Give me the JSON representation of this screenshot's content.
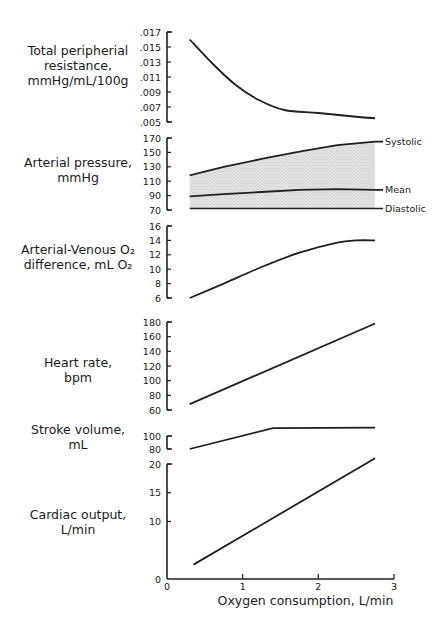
{
  "figure": {
    "x_axis": {
      "label": "Oxygen consumption, L/min",
      "ticks": [
        "0",
        "1",
        "2",
        "3"
      ],
      "range": [
        0,
        3
      ]
    },
    "panels": [
      {
        "id": "tpr",
        "label_lines": [
          "Total peripherial",
          "resistance,",
          "mmHg/mL/100g"
        ],
        "ticks": [
          ".017",
          ".015",
          ".013",
          ".011",
          ".009",
          ".007",
          ".005"
        ]
      },
      {
        "id": "pressure",
        "label_lines": [
          "Arterial pressure,",
          "mmHg"
        ],
        "ticks": [
          "170",
          "150",
          "130",
          "110",
          "90",
          "70"
        ],
        "series_labels": [
          "Systolic",
          "Mean",
          "Diastolic"
        ]
      },
      {
        "id": "avo2",
        "label_lines": [
          "Arterial-Venous O₂",
          "difference,  mL O₂"
        ],
        "ticks": [
          "16",
          "14",
          "12",
          "10",
          "8",
          "6"
        ]
      },
      {
        "id": "hr",
        "label_lines": [
          "Heart rate,",
          "bpm"
        ],
        "ticks": [
          "180",
          "160",
          "140",
          "120",
          "100",
          "80",
          "60"
        ]
      },
      {
        "id": "sv",
        "label_lines": [
          "Stroke volume,",
          "mL"
        ],
        "ticks": [
          "100",
          "80"
        ]
      },
      {
        "id": "co",
        "label_lines": [
          "Cardiac output,",
          "L/min"
        ],
        "ticks": [
          "20",
          "15",
          "10",
          "0"
        ]
      }
    ]
  },
  "chart_data": [
    {
      "type": "line",
      "title": "Total peripherial resistance",
      "ylabel": "Total peripherial resistance, mmHg/mL/100g",
      "xlabel": "Oxygen consumption, L/min",
      "ylim": [
        0.005,
        0.017
      ],
      "yticks": [
        0.017,
        0.015,
        0.013,
        0.011,
        0.009,
        0.007,
        0.005
      ],
      "grid": false,
      "x": [
        0.3,
        0.6,
        0.9,
        1.2,
        1.55,
        2.0,
        2.5,
        2.75
      ],
      "values": [
        0.016,
        0.0128,
        0.01,
        0.008,
        0.0066,
        0.0062,
        0.0057,
        0.0055
      ]
    },
    {
      "type": "area",
      "title": "Arterial pressure",
      "ylabel": "Arterial pressure, mmHg",
      "xlabel": "Oxygen consumption, L/min",
      "ylim": [
        70,
        170
      ],
      "yticks": [
        170,
        150,
        130,
        110,
        90,
        70
      ],
      "grid": false,
      "x": [
        0.3,
        0.75,
        1.25,
        1.75,
        2.25,
        2.75
      ],
      "series": [
        {
          "name": "Systolic",
          "values": [
            118,
            130,
            141,
            151,
            160,
            165
          ]
        },
        {
          "name": "Mean",
          "values": [
            89,
            92,
            95,
            98,
            99,
            98
          ]
        },
        {
          "name": "Diastolic",
          "values": [
            72,
            72,
            72,
            72,
            72,
            72
          ]
        }
      ],
      "annotations": [
        "Systolic",
        "Mean",
        "Diastolic"
      ],
      "fill": "shaded region between Systolic and Diastolic"
    },
    {
      "type": "line",
      "title": "Arterial-Venous O2 difference",
      "ylabel": "Arterial-Venous O2 difference, mL O2",
      "xlabel": "Oxygen consumption, L/min",
      "ylim": [
        6,
        16
      ],
      "yticks": [
        16,
        14,
        12,
        10,
        8,
        6
      ],
      "grid": false,
      "x": [
        0.3,
        0.75,
        1.25,
        1.75,
        2.25,
        2.5,
        2.75
      ],
      "values": [
        6.0,
        8.0,
        10.3,
        12.3,
        13.7,
        14.0,
        14.0
      ]
    },
    {
      "type": "line",
      "title": "Heart rate",
      "ylabel": "Heart rate, bpm",
      "xlabel": "Oxygen consumption, L/min",
      "ylim": [
        60,
        180
      ],
      "yticks": [
        180,
        160,
        140,
        120,
        100,
        80,
        60
      ],
      "grid": false,
      "x": [
        0.3,
        2.75
      ],
      "values": [
        68,
        178
      ]
    },
    {
      "type": "line",
      "title": "Stroke volume",
      "ylabel": "Stroke volume, mL",
      "xlabel": "Oxygen consumption, L/min",
      "ylim": [
        80,
        100
      ],
      "yticks": [
        100,
        80
      ],
      "grid": false,
      "x": [
        0.3,
        1.4,
        2.75
      ],
      "values": [
        80,
        112,
        113
      ]
    },
    {
      "type": "line",
      "title": "Cardiac output",
      "ylabel": "Cardiac output, L/min",
      "xlabel": "Oxygen consumption, L/min",
      "xlim": [
        0,
        3
      ],
      "xticks": [
        0,
        1,
        2,
        3
      ],
      "ylim": [
        0,
        20
      ],
      "yticks": [
        20,
        15,
        10,
        0
      ],
      "grid": false,
      "x": [
        0.35,
        2.75
      ],
      "values": [
        2.5,
        21
      ]
    }
  ]
}
